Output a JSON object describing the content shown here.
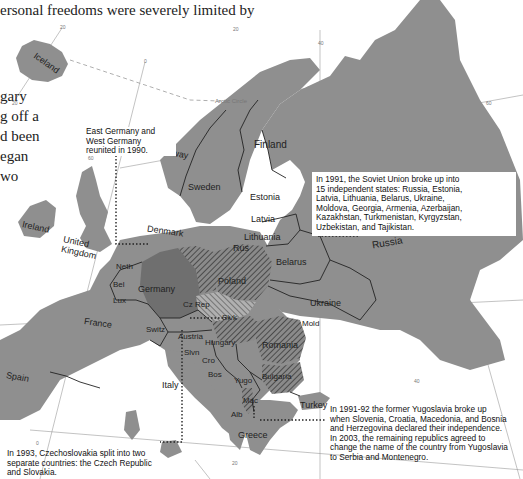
{
  "intro_text": {
    "line1": "ersonal freedoms were severely limited by",
    "fragments": [
      "gary",
      "g off a",
      "d been",
      "egan",
      "wo"
    ]
  },
  "grid_labels": {
    "lng_m20_top": "20",
    "lng_0": "0",
    "lng_20": "20",
    "lng_40": "40",
    "lng_60": "60",
    "lat_m20": "20",
    "lat_60": "60",
    "lat_40": "40",
    "lat_40_right": "40",
    "lng_0_bottom": "0",
    "lng_20_bottom": "20",
    "arctic_circle": "Arctic Circle"
  },
  "countries": {
    "iceland": "Iceland",
    "ireland": "Ireland",
    "united_kingdom": "United Kingdom",
    "norway": "Norway",
    "sweden": "Sweden",
    "finland": "Finland",
    "denmark": "Denmark",
    "estonia": "Estonia",
    "latvia": "Latvia",
    "lithuania": "Lithuania",
    "rus": "Rus",
    "belarus": "Belarus",
    "russia": "Russia",
    "poland": "Poland",
    "germany": "Germany",
    "neth": "Neth",
    "bel": "Bel",
    "lux": "Lux",
    "france": "France",
    "spain": "Spain",
    "switz": "Switz",
    "czech": "Cz Rep",
    "slovakia": "Slvk",
    "austria": "Austria",
    "hungary": "Hungary",
    "slvn": "Slvn",
    "cro": "Cro",
    "bos": "Bos",
    "yugo": "Yugo",
    "italy": "Italy",
    "ukraine": "Ukraine",
    "mold": "Mold",
    "romania": "Romania",
    "bulgaria": "Bulgaria",
    "mac": "Mac",
    "alb": "Alb",
    "greece": "Greece",
    "turkey": "Turkey"
  },
  "callouts": {
    "germany_reunion": {
      "lines": [
        "East Germany and",
        "West Germany",
        "reunited in 1990."
      ]
    },
    "soviet_union": {
      "lines": [
        "In 1991, the Soviet Union broke up into",
        "15 independent states: Russia, Estonia,",
        "Latvia, Lithuania, Belarus, Ukraine,",
        "Moldova, Georgia, Armenia, Azerbaijan,",
        "Kazakhstan, Turkmenistan, Kyrgyzstan,",
        "Uzbekistan, and Tajikistan."
      ]
    },
    "yugoslavia": {
      "lines": [
        "In 1991-92 the former Yugoslavia broke up",
        "when Slovenia, Croatia, Macedonia, and Bosnia",
        "and Herzegovina declared their independence.",
        "In 2003, the remaining republics agreed to",
        "change the name of the country from Yugoslavia",
        "to Serbia and Montenegro."
      ]
    },
    "czechoslovakia": {
      "lines": [
        "In 1993, Czechoslovakia split into two",
        "separate countries: the Czech Republic",
        "and Slovakia."
      ]
    }
  },
  "colors": {
    "land": "#8f8f8f",
    "land_dark": "#6f6f6f",
    "water": "#ffffff",
    "border": "#222222",
    "grid": "#9a9a9a",
    "hatch": "#3a3a3a",
    "leader": "#222222"
  }
}
